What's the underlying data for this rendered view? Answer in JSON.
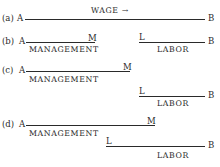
{
  "panels": {
    "a": {
      "label": "(a)",
      "left_end": "A",
      "right_end": "B",
      "caption": "WAGE →"
    },
    "b": {
      "label": "(b)",
      "left_end": "A",
      "m_marker": "M",
      "management": "MANAGEMENT",
      "l_marker": "L",
      "right_end": "B",
      "labor": "LABOR"
    },
    "c": {
      "label": "(c)",
      "left_end": "A",
      "m_marker": "M",
      "management": "MANAGEMENT",
      "l_marker": "L",
      "right_end": "B",
      "labor": "LABOR"
    },
    "d": {
      "label": "(d)",
      "left_end": "A",
      "m_marker": "M",
      "management": "MANAGEMENT",
      "l_marker": "L",
      "right_end": "B",
      "labor": "LABOR"
    }
  }
}
